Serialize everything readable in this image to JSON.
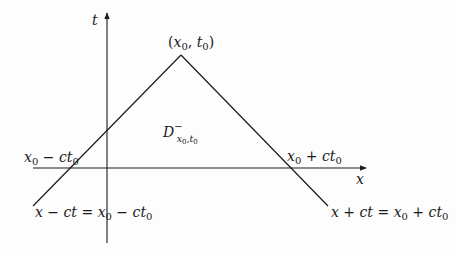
{
  "figure": {
    "colors": {
      "ink": "#1a1a1a",
      "background": "#fdfdfd"
    }
  },
  "axes": {
    "t_label": "t",
    "x_label": "x"
  },
  "points": {
    "apex_label_open": "(",
    "apex_x": "x",
    "apex_x_sub": "0",
    "apex_sep": ", ",
    "apex_t": "t",
    "apex_t_sub": "0",
    "apex_label_close": ")"
  },
  "region": {
    "label_main": "D",
    "label_sup": "−",
    "label_sub_x": "x",
    "label_sub_x0": "0",
    "label_sub_sep": ",",
    "label_sub_t": "t",
    "label_sub_t0": "0"
  },
  "intercepts": {
    "left": {
      "x": "x",
      "x_sub": "0",
      "rest": " − ",
      "c": "ct",
      "c_sub": "0"
    },
    "right": {
      "x": "x",
      "x_sub": "0",
      "rest": " + ",
      "c": "ct",
      "c_sub": "0"
    }
  },
  "lines": {
    "left_eq": {
      "lhs": "x − ct = ",
      "x": "x",
      "x_sub": "0",
      "op": " − ",
      "c": "ct",
      "c_sub": "0"
    },
    "right_eq": {
      "lhs": "x + ct = ",
      "x": "x",
      "x_sub": "0",
      "op": " + ",
      "c": "ct",
      "c_sub": "0"
    }
  }
}
